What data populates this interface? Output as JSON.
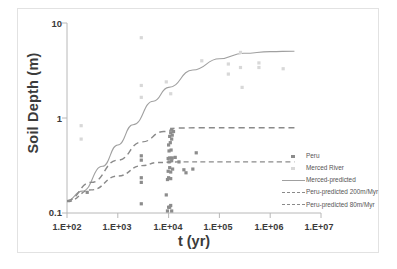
{
  "chart_data": {
    "type": "scatter",
    "title": "",
    "xlabel": "t (yr)",
    "ylabel": "Soil Depth (m)",
    "xscale": "log",
    "yscale": "log",
    "xlim": [
      100,
      10000000
    ],
    "ylim": [
      0.1,
      10
    ],
    "grid": false,
    "legend_position": "bottom-right",
    "xtick_labels": [
      "1.E+02",
      "1.E+03",
      "1.E+04",
      "1.E+05",
      "1.E+06",
      "1.E+07"
    ],
    "xtick_values": [
      100,
      1000,
      10000,
      100000,
      1000000,
      10000000
    ],
    "ytick_labels": [
      "10",
      "1",
      "0.1"
    ],
    "ytick_values": [
      10,
      1,
      0.1
    ],
    "series": [
      {
        "name": "Peru",
        "type": "scatter",
        "marker": "square",
        "color": "#8c8c8c",
        "points": [
          [
            250,
            0.165
          ],
          [
            2900,
            0.125
          ],
          [
            2900,
            0.21
          ],
          [
            2900,
            0.235
          ],
          [
            2900,
            0.4
          ],
          [
            2900,
            0.36
          ],
          [
            9000,
            0.155
          ],
          [
            9500,
            0.105
          ],
          [
            10000,
            0.115
          ],
          [
            10500,
            0.115
          ],
          [
            11000,
            0.12
          ],
          [
            11500,
            0.105
          ],
          [
            9500,
            0.225
          ],
          [
            10000,
            0.235
          ],
          [
            11000,
            0.23
          ],
          [
            9800,
            0.275
          ],
          [
            11000,
            0.27
          ],
          [
            10500,
            0.3
          ],
          [
            12000,
            0.29
          ],
          [
            10200,
            0.345
          ],
          [
            11500,
            0.355
          ],
          [
            9800,
            0.375
          ],
          [
            10500,
            0.38
          ],
          [
            11800,
            0.38
          ],
          [
            13500,
            0.385
          ],
          [
            10200,
            0.45
          ],
          [
            11200,
            0.46
          ],
          [
            10000,
            0.52
          ],
          [
            10800,
            0.55
          ],
          [
            11500,
            0.6
          ],
          [
            10500,
            0.64
          ],
          [
            11800,
            0.66
          ],
          [
            11000,
            0.7
          ],
          [
            12500,
            0.72
          ],
          [
            11500,
            0.76
          ],
          [
            20000,
            0.285
          ],
          [
            30000,
            0.29
          ],
          [
            22000,
            0.265
          ],
          [
            35000,
            0.43
          ],
          [
            16000,
            0.345
          ]
        ]
      },
      {
        "name": "Merced River",
        "type": "scatter",
        "marker": "square",
        "color": "#d8d8d8",
        "points": [
          [
            190,
            0.83
          ],
          [
            190,
            0.6
          ],
          [
            2900,
            7.0
          ],
          [
            2900,
            2.2
          ],
          [
            2900,
            1.65
          ],
          [
            9000,
            2.4
          ],
          [
            11000,
            1.8
          ],
          [
            45000,
            4.0
          ],
          [
            150000,
            3.7
          ],
          [
            150000,
            2.9
          ],
          [
            260000,
            4.9
          ],
          [
            260000,
            3.4
          ],
          [
            280000,
            2.1
          ],
          [
            600000,
            3.8
          ],
          [
            600000,
            3.4
          ],
          [
            1800000,
            3.3
          ]
        ]
      }
    ],
    "curves": [
      {
        "name": "Merced-predicted",
        "style": "solid",
        "color": "#a0a0a0",
        "plateau": 5.0,
        "points": [
          [
            100,
            0.135
          ],
          [
            200,
            0.17
          ],
          [
            500,
            0.31
          ],
          [
            1000,
            0.52
          ],
          [
            2000,
            0.85
          ],
          [
            5000,
            1.5
          ],
          [
            10000,
            2.1
          ],
          [
            30000,
            3.2
          ],
          [
            100000,
            4.2
          ],
          [
            300000,
            4.8
          ],
          [
            1000000,
            5.0
          ],
          [
            3000000,
            5.05
          ]
        ]
      },
      {
        "name": "Peru-predicted 200m/Myr",
        "style": "dashed",
        "color": "#8a8a8a",
        "plateau": 0.79,
        "points": [
          [
            100,
            0.135
          ],
          [
            300,
            0.21
          ],
          [
            1000,
            0.36
          ],
          [
            3000,
            0.56
          ],
          [
            8000,
            0.72
          ],
          [
            15000,
            0.785
          ],
          [
            40000,
            0.79
          ],
          [
            300000,
            0.79
          ],
          [
            3000000,
            0.79
          ]
        ]
      },
      {
        "name": "Peru-predicted 80m/Myr",
        "style": "dashed",
        "color": "#8a8a8a",
        "plateau": 0.345,
        "points": [
          [
            100,
            0.132
          ],
          [
            300,
            0.175
          ],
          [
            1000,
            0.245
          ],
          [
            3000,
            0.315
          ],
          [
            6000,
            0.34
          ],
          [
            15000,
            0.345
          ],
          [
            100000,
            0.345
          ],
          [
            3000000,
            0.345
          ]
        ]
      }
    ],
    "legend": [
      {
        "label": "Peru",
        "key": "marker-dark"
      },
      {
        "label": "Merced River",
        "key": "marker-light"
      },
      {
        "label": "Merced-predicted",
        "key": "line-solid"
      },
      {
        "label": "Peru-predicted 200m/Myr",
        "key": "line-dash-long"
      },
      {
        "label": "Peru-predicted 80m/Myr",
        "key": "line-dash-short"
      }
    ]
  },
  "axes": {
    "y_title": "Soil Depth (m)",
    "x_title": "t (yr)",
    "y_ticks": [
      "10",
      "1",
      "0.1"
    ],
    "x_ticks": [
      "1.E+02",
      "1.E+03",
      "1.E+04",
      "1.E+05",
      "1.E+06",
      "1.E+07"
    ]
  }
}
